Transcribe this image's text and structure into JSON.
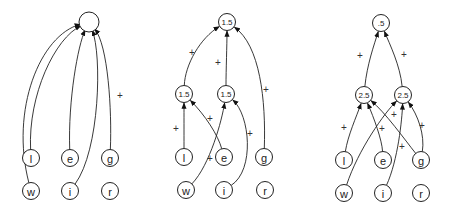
{
  "panels": [
    {
      "name": "panel-1",
      "nodes": [
        {
          "id": "top",
          "label": ""
        },
        {
          "id": "l",
          "label": "l"
        },
        {
          "id": "e",
          "label": "e"
        },
        {
          "id": "g",
          "label": "g"
        },
        {
          "id": "w",
          "label": "w"
        },
        {
          "id": "i",
          "label": "i"
        },
        {
          "id": "r",
          "label": "r"
        }
      ],
      "edges": [
        {
          "from": "w",
          "to": "top",
          "sign": ""
        },
        {
          "from": "l",
          "to": "top",
          "sign": ""
        },
        {
          "from": "e",
          "to": "top",
          "sign": ""
        },
        {
          "from": "i",
          "to": "top",
          "sign": ""
        },
        {
          "from": "g",
          "to": "top",
          "sign": "+"
        }
      ]
    },
    {
      "name": "panel-2",
      "nodes": [
        {
          "id": "top",
          "label": "1.5"
        },
        {
          "id": "h1",
          "label": "1.5"
        },
        {
          "id": "h2",
          "label": "1.5"
        },
        {
          "id": "l",
          "label": "l"
        },
        {
          "id": "e",
          "label": "e"
        },
        {
          "id": "g",
          "label": "g"
        },
        {
          "id": "w",
          "label": "w"
        },
        {
          "id": "i",
          "label": "i"
        },
        {
          "id": "r",
          "label": "r"
        }
      ],
      "edges": [
        {
          "from": "h1",
          "to": "top",
          "sign": "+"
        },
        {
          "from": "h2",
          "to": "top",
          "sign": "+"
        },
        {
          "from": "g",
          "to": "top",
          "sign": "+"
        },
        {
          "from": "l",
          "to": "h1",
          "sign": "+"
        },
        {
          "from": "e",
          "to": "h1",
          "sign": "+"
        },
        {
          "from": "w",
          "to": "h2",
          "sign": "+"
        },
        {
          "from": "i",
          "to": "h2",
          "sign": "+"
        }
      ]
    },
    {
      "name": "panel-3",
      "nodes": [
        {
          "id": "top",
          "label": ".5"
        },
        {
          "id": "h1",
          "label": "2.5"
        },
        {
          "id": "h2",
          "label": "2.5"
        },
        {
          "id": "l",
          "label": "l"
        },
        {
          "id": "e",
          "label": "e"
        },
        {
          "id": "g",
          "label": "g"
        },
        {
          "id": "w",
          "label": "w"
        },
        {
          "id": "i",
          "label": "i"
        },
        {
          "id": "r",
          "label": "r"
        }
      ],
      "edges": [
        {
          "from": "h1",
          "to": "top",
          "sign": "+"
        },
        {
          "from": "h2",
          "to": "top",
          "sign": "+"
        },
        {
          "from": "l",
          "to": "h1",
          "sign": "+"
        },
        {
          "from": "e",
          "to": "h1",
          "sign": "+"
        },
        {
          "from": "g",
          "to": "h1",
          "sign": ""
        },
        {
          "from": "w",
          "to": "h2",
          "sign": "+"
        },
        {
          "from": "i",
          "to": "h2",
          "sign": "+"
        },
        {
          "from": "g",
          "to": "h2",
          "sign": "+"
        }
      ]
    }
  ]
}
